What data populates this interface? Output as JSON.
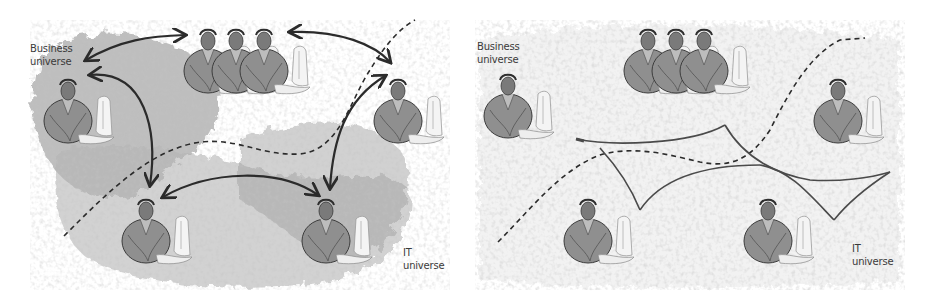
{
  "panels": [
    {
      "id": "left",
      "description": "Point-to-point communication between business and IT actors",
      "labels": {
        "business": [
          "Business",
          "universe"
        ],
        "it": [
          "IT",
          "universe"
        ]
      }
    },
    {
      "id": "right",
      "description": "Shared communication layer connecting business and IT actors",
      "labels": {
        "business": [
          "Business",
          "universe"
        ],
        "it": [
          "IT",
          "universe"
        ]
      }
    }
  ],
  "colors": {
    "ink": "#2b2b2b",
    "shade_dark": "#7d7d7d",
    "shade_light": "#c9c9c9",
    "figure_body": "#8f8f8f",
    "label_text": "#3a3a3a"
  }
}
